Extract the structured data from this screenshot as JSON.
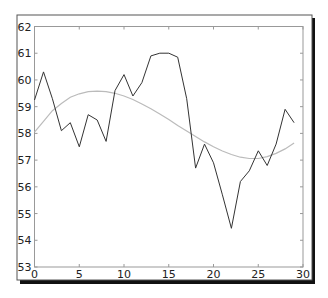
{
  "chart_data": {
    "type": "line",
    "title": "",
    "xlabel": "",
    "ylabel": "",
    "xlim": [
      0,
      30
    ],
    "ylim": [
      53,
      62
    ],
    "grid": false,
    "legend": null,
    "x_ticks": [
      0,
      5,
      10,
      15,
      20,
      25,
      30
    ],
    "y_ticks": [
      53,
      54,
      55,
      56,
      57,
      58,
      59,
      60,
      61,
      62
    ],
    "x_tick_labels": [
      "0",
      "5",
      "10",
      "15",
      "20",
      "25",
      "30"
    ],
    "y_tick_labels": [
      "53",
      "54",
      "55",
      "56",
      "57",
      "58",
      "59",
      "60",
      "61",
      "62"
    ],
    "x": [
      0,
      1,
      2,
      3,
      4,
      5,
      6,
      7,
      8,
      9,
      10,
      11,
      12,
      13,
      14,
      15,
      16,
      17,
      18,
      19,
      20,
      21,
      22,
      23,
      24,
      25,
      26,
      27,
      28,
      29
    ],
    "series": [
      {
        "name": "data",
        "color": "#333333",
        "style": "solid",
        "values": [
          59.25,
          60.3,
          59.3,
          58.1,
          58.4,
          57.5,
          58.7,
          58.5,
          57.7,
          59.6,
          60.2,
          59.4,
          59.9,
          60.9,
          61.0,
          61.0,
          60.85,
          59.3,
          56.7,
          57.6,
          56.9,
          55.7,
          54.45,
          56.2,
          56.6,
          57.35,
          56.8,
          57.6,
          58.9,
          58.4
        ]
      },
      {
        "name": "fit",
        "color": "#bbbbbb",
        "style": "solid",
        "values": [
          58.05,
          58.45,
          58.85,
          59.12,
          59.35,
          59.48,
          59.56,
          59.58,
          59.56,
          59.5,
          59.4,
          59.27,
          59.1,
          58.92,
          58.72,
          58.52,
          58.3,
          58.09,
          57.88,
          57.68,
          57.5,
          57.34,
          57.21,
          57.11,
          57.06,
          57.06,
          57.13,
          57.25,
          57.42,
          57.64
        ]
      }
    ]
  }
}
